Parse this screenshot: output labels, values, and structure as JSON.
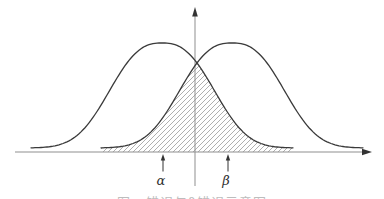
{
  "labels": {
    "alpha": "α",
    "beta": "β"
  },
  "caption": {
    "text": "图 α错误与β错误示意图"
  },
  "colors": {
    "background": "#ffffff",
    "curve": "#3a3a3a",
    "axis": "#8f8f8f",
    "arrow": "#333333",
    "hatch": "#a6a6a6",
    "label": "#2f2f2f",
    "caption": "#bdbdbd"
  },
  "diagram": {
    "canvas": {
      "width": 384,
      "height": 199
    },
    "curves": {
      "base_y": 148,
      "peak_y": 43,
      "sigma": 45,
      "shape_exponent": 1.3,
      "half_width": 131,
      "left_center_x": 162,
      "right_center_x": 232
    },
    "x_axis": {
      "y": 152,
      "x1": 15,
      "x2": 364
    },
    "y_axis": {
      "x": 195,
      "y_tip": 7,
      "y_bottom": 186
    },
    "overlap": {
      "x1": 101,
      "x2": 293
    },
    "hatch_spacing": 5,
    "markers": [
      {
        "id": "alpha",
        "x": 163,
        "label_x": 161,
        "label": "α"
      },
      {
        "id": "beta",
        "x": 228,
        "label_x": 226,
        "label": "β"
      }
    ]
  }
}
